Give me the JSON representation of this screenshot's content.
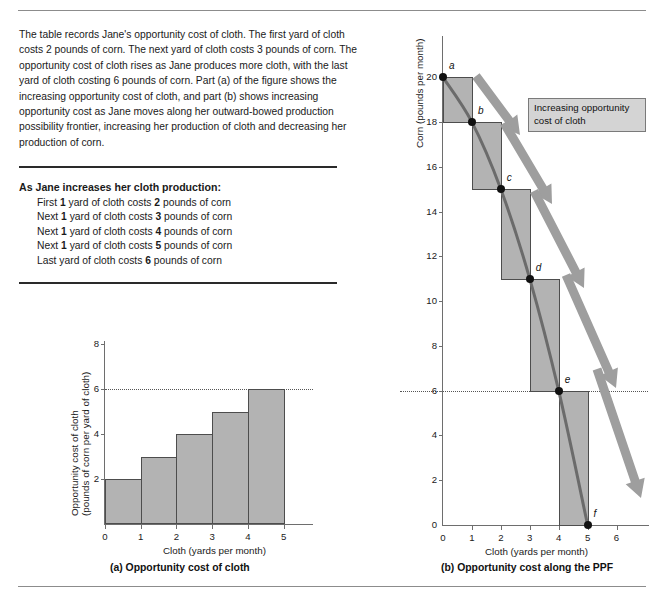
{
  "rules": {
    "top": "divider",
    "bottom": "divider"
  },
  "intro": {
    "paragraph": "The table records Jane's opportunity cost of cloth. The first yard of cloth costs 2 pounds of corn. The next yard of cloth costs 3 pounds of corn. The opportunity cost of cloth rises as Jane produces more cloth, with the last yard of cloth costing 6 pounds of corn. Part (a) of the figure shows the increasing opportunity cost of cloth, and part (b) shows increasing opportunity cost as Jane moves along her outward-bowed production possibility frontier, increasing her production of cloth and decreasing her production of corn."
  },
  "cost_list": {
    "title": "As Jane increases her cloth production:",
    "rows": [
      {
        "prefix": "First ",
        "qty": "1",
        "mid": " yard of cloth costs ",
        "cost": "2",
        "suffix": " pounds of corn"
      },
      {
        "prefix": "Next ",
        "qty": "1",
        "mid": " yard of cloth costs ",
        "cost": "3",
        "suffix": " pounds of corn"
      },
      {
        "prefix": "Next ",
        "qty": "1",
        "mid": " yard of cloth costs ",
        "cost": "4",
        "suffix": " pounds of corn"
      },
      {
        "prefix": "Next ",
        "qty": "1",
        "mid": " yard of cloth costs ",
        "cost": "5",
        "suffix": " pounds of corn"
      },
      {
        "prefix": "Last yard of cloth costs ",
        "qty": "",
        "mid": "",
        "cost": "6",
        "suffix": " pounds of corn"
      }
    ]
  },
  "captions": {
    "a": "(a) Opportunity cost of cloth",
    "b": "(b) Opportunity cost along the PPF"
  },
  "callout": {
    "line1": "Increasing opportunity",
    "line2": "cost of cloth"
  },
  "colors": {
    "bar_fill": "#b3b3b3",
    "bar_stroke": "#4d4d4d",
    "ppf_curve": "#6b6b6b",
    "arrow": "#9e9e9e",
    "callout_bg": "#d4d4d4",
    "axis": "#6e6e6e",
    "point": "#111111"
  },
  "chart_data": [
    {
      "id": "chart-a",
      "type": "bar",
      "title": "(a) Opportunity cost of cloth",
      "xlabel": "Cloth (yards per month)",
      "ylabel": "Opportunity cost of cloth (pounds of corn per yard of cloth)",
      "ylabel_line1": "Opportunity cost of cloth",
      "ylabel_line2": "(pounds of corn per yard of cloth)",
      "categories": [
        "0-1",
        "1-2",
        "2-3",
        "3-4",
        "4-5"
      ],
      "bar_starts": [
        0,
        1,
        2,
        3,
        4
      ],
      "bar_ends": [
        1,
        2,
        3,
        4,
        5
      ],
      "values": [
        2,
        3,
        4,
        5,
        6
      ],
      "xlim": [
        0,
        5.6
      ],
      "ylim": [
        0,
        8
      ],
      "xticks": [
        0,
        1,
        2,
        3,
        4,
        5
      ],
      "yticks": [
        2,
        4,
        6,
        8
      ],
      "xtick_labels": [
        "0",
        "1",
        "2",
        "3",
        "4",
        "5"
      ],
      "ytick_labels": [
        "2",
        "4",
        "6",
        "8"
      ],
      "reference_line_y": 6,
      "grid": false,
      "legend": "none"
    },
    {
      "id": "chart-b",
      "type": "line",
      "title": "(b) Opportunity cost along the PPF",
      "xlabel": "Cloth (yards per month)",
      "ylabel": "Corn (pounds per month)",
      "series": [
        {
          "name": "Production possibility frontier",
          "x": [
            0,
            1,
            2,
            3,
            4,
            5
          ],
          "y": [
            20,
            18,
            15,
            11,
            6,
            0
          ],
          "point_labels": [
            "a",
            "b",
            "c",
            "d",
            "e",
            "f"
          ]
        }
      ],
      "step_rectangles": [
        {
          "from": "a",
          "to": "b",
          "x0": 0,
          "x1": 1,
          "y_top": 20,
          "y_bottom": 18,
          "corn_cost": 2
        },
        {
          "from": "b",
          "to": "c",
          "x0": 1,
          "x1": 2,
          "y_top": 18,
          "y_bottom": 15,
          "corn_cost": 3
        },
        {
          "from": "c",
          "to": "d",
          "x0": 2,
          "x1": 3,
          "y_top": 15,
          "y_bottom": 11,
          "corn_cost": 4
        },
        {
          "from": "d",
          "to": "e",
          "x0": 3,
          "x1": 4,
          "y_top": 11,
          "y_bottom": 6,
          "corn_cost": 5
        },
        {
          "from": "e",
          "to": "f",
          "x0": 4,
          "x1": 5,
          "y_top": 6,
          "y_bottom": 0,
          "corn_cost": 6
        }
      ],
      "xlim": [
        0,
        6.5
      ],
      "ylim": [
        0,
        21
      ],
      "xticks": [
        0,
        1,
        2,
        3,
        4,
        5,
        6
      ],
      "yticks": [
        0,
        2,
        4,
        6,
        8,
        10,
        12,
        14,
        16,
        18,
        20
      ],
      "xtick_labels": [
        "0",
        "1",
        "2",
        "3",
        "4",
        "5",
        "6"
      ],
      "ytick_labels": [
        "0",
        "2",
        "4",
        "6",
        "8",
        "10",
        "12",
        "14",
        "16",
        "18",
        "20"
      ],
      "reference_line_y": 6,
      "annotations": [
        "Increasing opportunity cost of cloth"
      ],
      "grid": false,
      "legend": "none"
    }
  ]
}
